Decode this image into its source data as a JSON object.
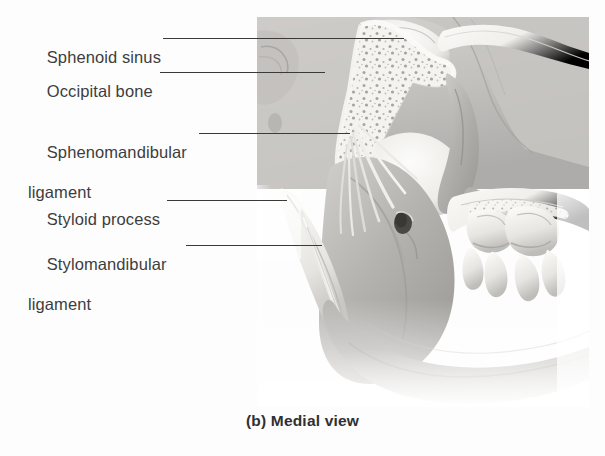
{
  "figure": {
    "caption": "(b) Medial view",
    "view_label": "Medial view",
    "panel_letter": "(b)",
    "illustration_name": "medial-view-of-mandible-and-temporomandibular-ligaments",
    "style": "grayscale anatomical airbrush illustration",
    "colors": {
      "background": "#fdfdfd",
      "text": "#3d3d3d",
      "leader_line": "#3a3a3a",
      "caption": "#303030",
      "bone_light": "#f2f1ee",
      "bone_mid": "#c9c7c4",
      "bone_shadow": "#8e8c89",
      "soft_tissue": "#b7b5b2"
    }
  },
  "labels": [
    {
      "id": "sphenoid-sinus",
      "line1": "Sphenoid sinus",
      "line2": "",
      "text_x": 28,
      "text_y": 27,
      "leader": {
        "x": 163,
        "y": 38,
        "width": 241
      }
    },
    {
      "id": "occipital-bone",
      "line1": "Occipital bone",
      "line2": "",
      "text_x": 28,
      "text_y": 61,
      "leader": {
        "x": 160,
        "y": 72,
        "width": 165
      }
    },
    {
      "id": "sphenomandibular-ligament",
      "line1": "Sphenomandibular",
      "line2": "ligament",
      "text_x": 28,
      "text_y": 122,
      "leader": {
        "x": 199,
        "y": 133,
        "width": 151
      }
    },
    {
      "id": "styloid-process",
      "line1": "Styloid process",
      "line2": "",
      "text_x": 28,
      "text_y": 189,
      "leader": {
        "x": 167,
        "y": 200,
        "width": 120
      }
    },
    {
      "id": "stylomandibular-ligament",
      "line1": "Stylomandibular",
      "line2": "ligament",
      "text_x": 28,
      "text_y": 234,
      "leader": {
        "x": 186,
        "y": 245,
        "width": 136
      }
    }
  ],
  "structures": [
    {
      "name": "sphenoid-sinus",
      "description": "air-filled cavity in sphenoid body, upper left of plate"
    },
    {
      "name": "occipital-bone",
      "description": "cancellous bone with trabecular speckling, upper centre"
    },
    {
      "name": "sphenomandibular-ligament",
      "description": "fan of fibres descending from spine of sphenoid to lingula"
    },
    {
      "name": "styloid-process",
      "description": "slender pointed bony spike, left side"
    },
    {
      "name": "stylomandibular-ligament",
      "description": "narrow band from styloid process to mandibular angle"
    },
    {
      "name": "mandibular-foramen",
      "description": "dark oval opening on medial ramus"
    },
    {
      "name": "mandibular-ramus",
      "description": "broad flat plate of jaw bone"
    },
    {
      "name": "mandibular-body",
      "description": "horizontal lower portion of jaw"
    },
    {
      "name": "molar-teeth",
      "description": "row of molar crowns and roots, right side"
    },
    {
      "name": "coronoid-process",
      "description": "upward pointed projection anterior to condyle"
    },
    {
      "name": "condylar-process",
      "description": "rounded head articulating at temporomandibular joint"
    }
  ]
}
